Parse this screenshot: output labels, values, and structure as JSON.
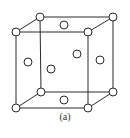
{
  "figure": {
    "caption": "(a)",
    "atom_radius": 4,
    "colors": {
      "line": "#2a2a2a",
      "atom_fill": "#ffffff",
      "background": "#ffffff"
    },
    "corners": {
      "front_top_left": [
        16,
        32
      ],
      "front_top_right": [
        88,
        32
      ],
      "front_bottom_left": [
        16,
        108
      ],
      "front_bottom_right": [
        88,
        108
      ],
      "back_top_left": [
        40,
        17
      ],
      "back_top_right": [
        113,
        17
      ],
      "back_bottom_left": [
        41,
        92
      ],
      "back_bottom_right": [
        113,
        92
      ]
    },
    "face_centers": {
      "top": [
        64,
        25
      ],
      "bottom": [
        64,
        100
      ],
      "left": [
        28,
        62
      ],
      "right": [
        100,
        60
      ],
      "front": [
        51,
        69
      ],
      "back": [
        77,
        54
      ]
    }
  }
}
